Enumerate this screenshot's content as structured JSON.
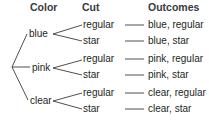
{
  "headers": {
    "color": "Color",
    "cut": "Cut",
    "outcomes": "Outcomes"
  },
  "tree": {
    "colors": [
      {
        "label": "blue",
        "cuts": [
          {
            "label": "regular",
            "outcome": "blue, regular"
          },
          {
            "label": "star",
            "outcome": "blue, star"
          }
        ]
      },
      {
        "label": "pink",
        "cuts": [
          {
            "label": "regular",
            "outcome": "pink, regular"
          },
          {
            "label": "star",
            "outcome": "pink, star"
          }
        ]
      },
      {
        "label": "clear",
        "cuts": [
          {
            "label": "regular",
            "outcome": "clear, regular"
          },
          {
            "label": "star",
            "outcome": "clear, star"
          }
        ]
      }
    ]
  },
  "colors": {
    "text": "#231f20",
    "header": "#3a3a3a",
    "line": "#231f20"
  }
}
